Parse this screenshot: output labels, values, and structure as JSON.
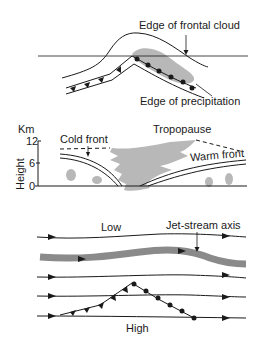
{
  "panel_plan": {
    "labels": {
      "cloud_edge": "Edge of frontal cloud",
      "precip_edge": "Edge of precipitation"
    }
  },
  "panel_section": {
    "axis_unit": "Km",
    "axis_label": "Height",
    "ticks": [
      "12",
      "6",
      "0"
    ],
    "labels": {
      "cold_front": "Cold front",
      "tropopause": "Tropopause",
      "warm_front": "Warm front"
    }
  },
  "panel_jet": {
    "labels": {
      "low": "Low",
      "high": "High",
      "jet_axis": "Jet-stream axis"
    }
  },
  "colors": {
    "line": "#1a1a1a",
    "cloud": "#b8b8b8",
    "jet": "#8a8a8a"
  }
}
